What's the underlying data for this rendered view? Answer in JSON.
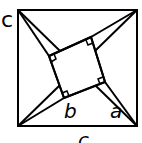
{
  "labels": {
    "corner": "c",
    "b": "b",
    "a": "a",
    "bottom": "c"
  }
}
